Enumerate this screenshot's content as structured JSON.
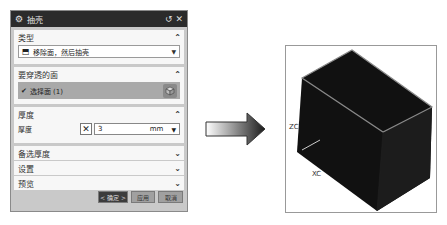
{
  "dialog": {
    "title": "抽壳",
    "title_icon": "gear-icon",
    "reset_icon": "reset-icon",
    "close_icon": "close-icon",
    "sections": {
      "type": {
        "label": "类型",
        "expanded": true,
        "dropdown_value": "移除面，然后抽壳",
        "dropdown_icon": "shell-icon"
      },
      "faces": {
        "label": "要穿透的面",
        "expanded": true,
        "selection_label": "选择面 (1)",
        "selection_icon": "face-select-cube-icon"
      },
      "thickness": {
        "label": "厚度",
        "expanded": true,
        "field_label": "厚度",
        "value": "3",
        "unit": "mm"
      },
      "alt_thickness": {
        "label": "备选厚度",
        "expanded": false
      },
      "settings": {
        "label": "设置",
        "expanded": false
      },
      "preview": {
        "label": "预览",
        "expanded": false
      }
    },
    "buttons": {
      "ok": "< 确定 >",
      "apply": "应用",
      "cancel": "取消"
    }
  },
  "arrow": {
    "direction": "right"
  },
  "viewport": {
    "axis_z": "ZC",
    "axis_x": "XC",
    "model": "shelled-box"
  }
}
